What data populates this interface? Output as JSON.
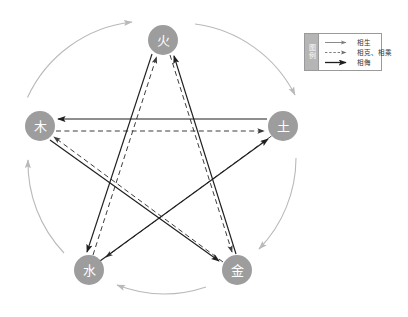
{
  "diagram": {
    "colors": {
      "node_fill": "#9d9d9d",
      "node_text": "#ffffff",
      "generating_arc": "#b9b9b9",
      "restraining_dashed": "#4a4a4a",
      "insulting_solid": "#2b2b2b",
      "legend_border": "#9a9a9a",
      "legend_title_bg": "#b5b5b5"
    },
    "nodes": [
      {
        "id": "fire",
        "label": "火",
        "cx": 163,
        "cy": 40,
        "r": 15
      },
      {
        "id": "earth",
        "label": "土",
        "cx": 283,
        "cy": 126,
        "r": 15
      },
      {
        "id": "metal",
        "label": "金",
        "cx": 237,
        "cy": 270,
        "r": 15
      },
      {
        "id": "water",
        "label": "水",
        "cx": 89,
        "cy": 270,
        "r": 15
      },
      {
        "id": "wood",
        "label": "木",
        "cx": 40,
        "cy": 126,
        "r": 15
      }
    ],
    "relations": {
      "generating": {
        "name": "相生",
        "style": "arc-light-gray",
        "edges": [
          {
            "from": "wood",
            "to": "fire"
          },
          {
            "from": "fire",
            "to": "earth"
          },
          {
            "from": "earth",
            "to": "metal"
          },
          {
            "from": "metal",
            "to": "water"
          },
          {
            "from": "water",
            "to": "wood"
          }
        ]
      },
      "restraining": {
        "name": "相克、相乘",
        "style": "dashed",
        "edges": [
          {
            "from": "wood",
            "to": "earth"
          },
          {
            "from": "earth",
            "to": "water"
          },
          {
            "from": "water",
            "to": "fire"
          },
          {
            "from": "fire",
            "to": "metal"
          },
          {
            "from": "metal",
            "to": "wood"
          }
        ]
      },
      "insulting": {
        "name": "相侮",
        "style": "solid",
        "edges": [
          {
            "from": "earth",
            "to": "wood"
          },
          {
            "from": "water",
            "to": "earth"
          },
          {
            "from": "fire",
            "to": "water"
          },
          {
            "from": "metal",
            "to": "fire"
          },
          {
            "from": "wood",
            "to": "metal"
          }
        ]
      }
    }
  },
  "legend": {
    "title": "图例",
    "box": {
      "x": 304,
      "y": 33,
      "w": 78,
      "h": 38
    },
    "items": [
      {
        "id": "legend-generating",
        "label": "相生",
        "style": "solid-thin-gray"
      },
      {
        "id": "legend-restraining",
        "label": "相克、相乘",
        "style": "dashed-gray"
      },
      {
        "id": "legend-insulting",
        "label": "相侮",
        "style": "solid-thick-dark"
      }
    ]
  }
}
